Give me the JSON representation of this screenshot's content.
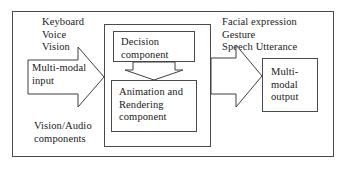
{
  "diagram": {
    "type": "block-diagram",
    "frame": {
      "label": "outer-system-boundary"
    },
    "labels": {
      "input_modalities": "Keyboard\nVoice\nVision",
      "output_modalities": "Facial expression\nGesture\nSpeech Utterance",
      "input_components": "Vision/Audio\ncomponents"
    },
    "arrows": {
      "input_arrow_label": "Multi-modal\ninput",
      "internal_arrow_label": "decision-to-animation-arrow",
      "output_arrow_label": "animation-to-output-arrow"
    },
    "boxes": {
      "container": "component-container",
      "decision": "Decision\ncomponent",
      "animation": "Animation and\nRendering\ncomponent",
      "output": "Multi-\nmodal\noutput"
    },
    "colors": {
      "stroke": "#4a4a4a",
      "arrow_stroke": "#3f3f3f",
      "background": "#ffffff",
      "text": "#1a1a1a"
    }
  }
}
